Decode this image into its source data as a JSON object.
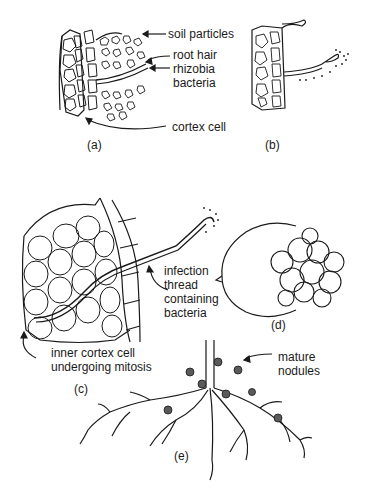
{
  "figure": {
    "panels": [
      {
        "id": "a",
        "caption": "(a)",
        "labels": [
          "soil particles",
          "root hair",
          "rhizobia",
          "bacteria",
          "cortex cell"
        ]
      },
      {
        "id": "b",
        "caption": "(b)",
        "labels": []
      },
      {
        "id": "c",
        "caption": "(c)",
        "labels": [
          "infection",
          "thread",
          "containing",
          "bacteria",
          "inner cortex cell",
          "undergoing mitosis"
        ]
      },
      {
        "id": "d",
        "caption": "(d)",
        "labels": []
      },
      {
        "id": "e",
        "caption": "(e)",
        "labels": [
          "mature",
          "nodules"
        ]
      }
    ]
  },
  "colors": {
    "ink": "#1a1a1a",
    "background": "#ffffff"
  }
}
